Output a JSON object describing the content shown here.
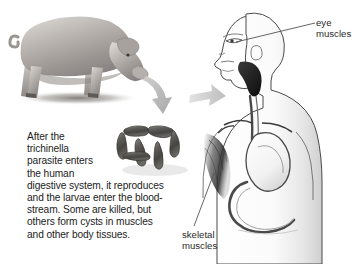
{
  "page": {
    "background_color": "#ffffff",
    "width": 364,
    "height": 264
  },
  "caption": {
    "line1": "After the",
    "line2": "trichinella",
    "line3": "parasite enters",
    "line4": "the human",
    "line5": "digestive system, it reproduces",
    "line6": "and the larvae enter the blood-",
    "line7": "stream. Some are killed, but",
    "line8": "others form cysts in muscles",
    "line9": "and other body tissues.",
    "text_color": "#1c1c1c"
  },
  "callouts": {
    "eye": "eye\nmuscles",
    "skeletal": "skeletal\nmuscles",
    "text_color": "#2a2a2a",
    "leader_color": "#555555"
  },
  "figures": {
    "pig": "pig-illustration",
    "worms": "trichinella-worm-cluster",
    "human": "human-torso-anatomy-illustration",
    "stomach": "stomach-organ",
    "intestine": "intestine-organ",
    "esophagus": "esophagus-organ",
    "eye": "eye-detail",
    "shoulder_muscle": "skeletal-muscle-shading"
  },
  "arrows": {
    "pig_to_worms": "curved-down-arrow",
    "worms_to_human": "right-arrow",
    "color": "#b6b6b6"
  },
  "colors": {
    "pig_body": "#a9a4a0",
    "worm_dark": "#4a4a48",
    "worm_light": "#9a9894",
    "outline": "#3c3c3c",
    "organ_fill": "#fbfbfb",
    "muscle_shade": "#4d4d4d"
  }
}
